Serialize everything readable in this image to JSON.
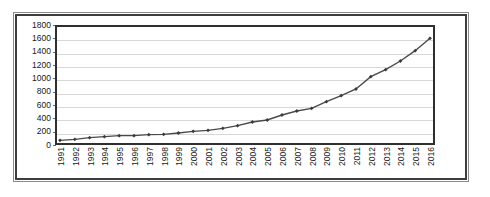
{
  "chart_data": {
    "type": "line",
    "title": "",
    "xlabel": "",
    "ylabel": "",
    "ylim": [
      0,
      1800
    ],
    "ytick_step": 200,
    "yticks": [
      1800,
      1600,
      1400,
      1200,
      1000,
      800,
      600,
      400,
      200,
      0
    ],
    "grid": true,
    "legend": "none",
    "marker": "diamond",
    "line_color": "#4a4a4a",
    "marker_color": "#3a3a3a",
    "gridline_color": "#d8d8d8",
    "border_color": "#2f2f2f",
    "categories": [
      "1991",
      "1992",
      "1993",
      "1994",
      "1995",
      "1996",
      "1997",
      "1998",
      "1999",
      "2000",
      "2001",
      "2002",
      "2003",
      "2004",
      "2005",
      "2006",
      "2007",
      "2008",
      "2009",
      "2010",
      "2011",
      "2012",
      "2013",
      "2014",
      "2015",
      "2016"
    ],
    "values": [
      70,
      85,
      110,
      125,
      140,
      140,
      155,
      160,
      180,
      205,
      220,
      250,
      290,
      345,
      375,
      450,
      510,
      550,
      650,
      740,
      840,
      1025,
      1130,
      1260,
      1415,
      1600
    ]
  }
}
